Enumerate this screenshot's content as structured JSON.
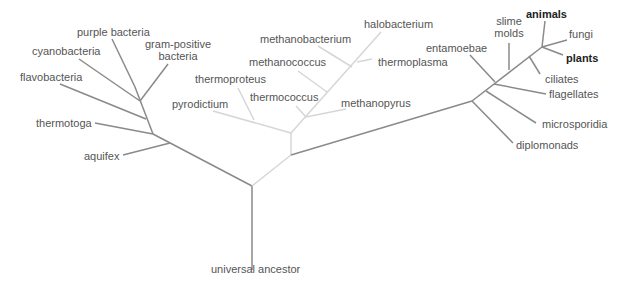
{
  "colors": {
    "bacteria": "#8a8a8a",
    "archaea": "#d6d6d6",
    "eukarya": "#8a8a8a",
    "root": "#8a8a8a"
  },
  "root": {
    "label": "universal ancestor"
  },
  "bacteria": {
    "label": "Bacteria",
    "leaves": [
      "purple bacteria",
      "cyanobacteria",
      "gram-positive",
      "bacteria",
      "flavobacteria",
      "thermotoga",
      "aquifex"
    ]
  },
  "archaea": {
    "label": "Archaea",
    "leaves": [
      "halobacterium",
      "methanobacterium",
      "methanococcus",
      "thermoplasma",
      "thermoproteus",
      "thermococcus",
      "pyrodictium",
      "methanopyrus"
    ]
  },
  "eukarya": {
    "label": "Eukarya",
    "leaves": [
      "slime",
      "molds",
      "animals",
      "entamoebae",
      "fungi",
      "plants",
      "ciliates",
      "flagellates",
      "microsporidia",
      "diplomonads"
    ]
  }
}
